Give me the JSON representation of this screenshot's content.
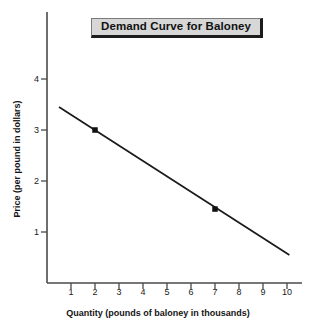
{
  "chart_data": {
    "type": "line",
    "title": "Demand Curve for Baloney",
    "xlabel": "Quantity (pounds of baloney in thousands)",
    "ylabel": "Price (per pound in dollars)",
    "xlim": [
      0,
      10.6
    ],
    "ylim": [
      0,
      4.6
    ],
    "xticks": [
      1,
      2,
      3,
      4,
      5,
      6,
      7,
      8,
      9,
      10
    ],
    "xtick_labels": [
      "1",
      "2",
      "3",
      "4",
      "5",
      "6",
      "7",
      "8",
      "9",
      "10"
    ],
    "yticks": [
      1,
      2,
      3,
      4
    ],
    "ytick_labels": [
      "1",
      "2",
      "3",
      "4"
    ],
    "grid": false,
    "legend": null,
    "series": [
      {
        "name": "Demand",
        "kind": "line",
        "color": "#1a1a1a",
        "x": [
          0.5,
          10.1
        ],
        "y": [
          3.45,
          0.55
        ]
      }
    ],
    "markers": [
      {
        "label": "point-a",
        "x": 2,
        "y": 3.0,
        "shape": "square",
        "color": "#111111"
      },
      {
        "label": "point-b",
        "x": 7,
        "y": 1.45,
        "shape": "square",
        "color": "#111111"
      }
    ]
  },
  "title_box": {
    "text": "Demand Curve for Baloney",
    "fill": "#d7d7d7",
    "shadow": "#1c1c1c"
  },
  "colors": {
    "axis": "#4a4a4a",
    "line": "#1a1a1a",
    "background": "#ffffff",
    "text": "#141414"
  }
}
